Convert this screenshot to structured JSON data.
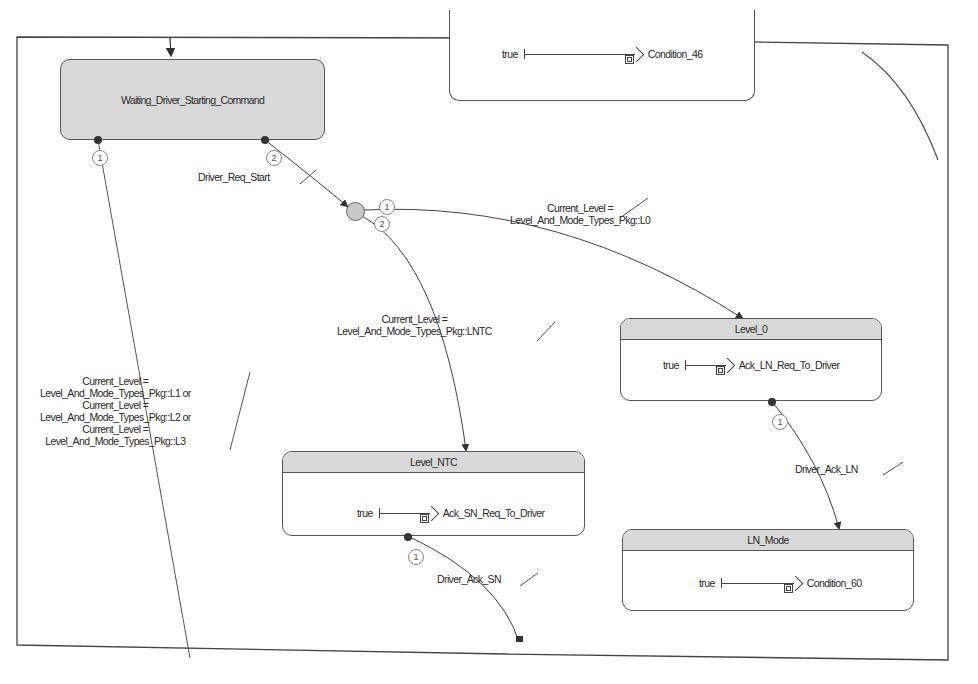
{
  "diagram": {
    "type": "state_machine",
    "states": [
      {
        "id": "waiting",
        "name": "Waiting_Driver_Starting_Command",
        "style": "filled"
      },
      {
        "id": "top_partial",
        "name": "",
        "action": {
          "condition": "true",
          "target": "Condition_46"
        }
      },
      {
        "id": "level_0",
        "name": "Level_0",
        "action": {
          "condition": "true",
          "target": "Ack_LN_Req_To_Driver"
        }
      },
      {
        "id": "level_ntc",
        "name": "Level_NTC",
        "action": {
          "condition": "true",
          "target": "Ack_SN_Req_To_Driver"
        }
      },
      {
        "id": "ln_mode",
        "name": "LN_Mode",
        "action": {
          "condition": "true",
          "target": "Condition_60"
        }
      }
    ],
    "junction": {
      "id": "j1",
      "fill": "#c8c8c8"
    },
    "transitions": [
      {
        "from": "waiting",
        "to": "offpage_bottom",
        "order": "1",
        "label_lines": [
          "Current_Level =",
          "Level_And_Mode_Types_Pkg::L1 or",
          "Current_Level =",
          "Level_And_Mode_Types_Pkg::L2 or",
          "Current_Level =",
          "Level_And_Mode_Types_Pkg::L3"
        ]
      },
      {
        "from": "waiting",
        "to": "j1",
        "order": "2",
        "label_lines": [
          "Driver_Req_Start"
        ]
      },
      {
        "from": "j1",
        "to": "level_0",
        "order": "1",
        "label_lines": [
          "Current_Level =",
          "Level_And_Mode_Types_Pkg::L0"
        ]
      },
      {
        "from": "j1",
        "to": "level_ntc",
        "order": "2",
        "label_lines": [
          "Current_Level =",
          "Level_And_Mode_Types_Pkg::LNTC"
        ]
      },
      {
        "from": "level_0",
        "to": "ln_mode",
        "order": "1",
        "label_lines": [
          "Driver_Ack_LN"
        ]
      },
      {
        "from": "level_ntc",
        "to": "offpage_bottom_2",
        "order": "1",
        "label_lines": [
          "Driver_Ack_SN"
        ]
      }
    ]
  },
  "labels": {
    "waiting": "Waiting_Driver_Starting_Command",
    "level_0": "Level_0",
    "level_ntc": "Level_NTC",
    "ln_mode": "LN_Mode",
    "true": "true",
    "condition_46": "Condition_46",
    "ack_ln": "Ack_LN_Req_To_Driver",
    "ack_sn": "Ack_SN_Req_To_Driver",
    "condition_60": "Condition_60",
    "driver_req_start": "Driver_Req_Start",
    "l0_line1": "Current_Level =",
    "l0_line2": "Level_And_Mode_Types_Pkg::L0",
    "lntc_line1": "Current_Level =",
    "lntc_line2": "Level_And_Mode_Types_Pkg::LNTC",
    "l123_line1": "Current_Level =",
    "l123_line2": "Level_And_Mode_Types_Pkg::L1 or",
    "l123_line3": "Current_Level =",
    "l123_line4": "Level_And_Mode_Types_Pkg::L2 or",
    "l123_line5": "Current_Level =",
    "l123_line6": "Level_And_Mode_Types_Pkg::L3",
    "driver_ack_ln": "Driver_Ack_LN",
    "driver_ack_sn": "Driver_Ack_SN",
    "n1": "1",
    "n2": "2"
  }
}
